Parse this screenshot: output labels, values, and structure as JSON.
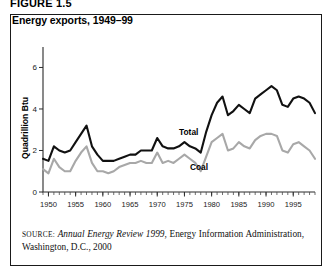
{
  "figure": {
    "label": "FIGURE 1.5"
  },
  "panel": {
    "title": "Energy exports, 1949–99"
  },
  "source": {
    "prefix": "SOURCE:",
    "italic_part": "Annual Energy Review 1999",
    "rest": ", Energy Information Administration, Washington, D.C., 2000"
  },
  "labels": {
    "total": "Total",
    "coal": "Coal"
  },
  "colors": {
    "total_line": "#111111",
    "coal_line": "#a8a8a8",
    "border": "#1a1a1a",
    "axis": "#2b2b2b"
  },
  "chart_data": {
    "type": "line",
    "title": "Energy exports, 1949–99",
    "xlabel": "",
    "ylabel": "Quadrillion Btu",
    "xlim": [
      1949,
      1999
    ],
    "ylim": [
      0,
      6.6
    ],
    "yticks": [
      0,
      2,
      4,
      6
    ],
    "ytick_labels": [
      "0",
      "2",
      "4",
      "6"
    ],
    "xticks": [
      1950,
      1955,
      1960,
      1965,
      1970,
      1975,
      1980,
      1985,
      1990,
      1995
    ],
    "xtick_labels": [
      "1950",
      "1955",
      "1960",
      "1965",
      "1970",
      "1975",
      "1980",
      "1985",
      "1990",
      "1995"
    ],
    "minor_xtick_interval": 1,
    "grid": false,
    "legend": "inline-annotations",
    "x": [
      1949,
      1950,
      1951,
      1952,
      1953,
      1954,
      1955,
      1956,
      1957,
      1958,
      1959,
      1960,
      1961,
      1962,
      1963,
      1964,
      1965,
      1966,
      1967,
      1968,
      1969,
      1970,
      1971,
      1972,
      1973,
      1974,
      1975,
      1976,
      1977,
      1978,
      1979,
      1980,
      1981,
      1982,
      1983,
      1984,
      1985,
      1986,
      1987,
      1988,
      1989,
      1990,
      1991,
      1992,
      1993,
      1994,
      1995,
      1996,
      1997,
      1998,
      1999
    ],
    "series": [
      {
        "name": "Total",
        "color": "#111111",
        "values": [
          1.6,
          1.5,
          2.2,
          2.0,
          1.9,
          2.0,
          2.4,
          2.8,
          3.2,
          2.2,
          1.8,
          1.5,
          1.5,
          1.5,
          1.6,
          1.7,
          1.8,
          1.8,
          2.0,
          2.0,
          2.0,
          2.6,
          2.2,
          2.1,
          2.1,
          2.2,
          2.4,
          2.2,
          2.1,
          1.9,
          2.9,
          3.7,
          4.3,
          4.6,
          3.7,
          3.9,
          4.2,
          4.0,
          3.8,
          4.5,
          4.7,
          4.9,
          5.1,
          4.9,
          4.2,
          4.1,
          4.5,
          4.6,
          4.5,
          4.3,
          3.8
        ]
      },
      {
        "name": "Coal",
        "color": "#a8a8a8",
        "values": [
          1.1,
          0.9,
          1.6,
          1.2,
          1.0,
          1.0,
          1.5,
          1.9,
          2.2,
          1.4,
          1.0,
          1.0,
          0.9,
          1.0,
          1.2,
          1.3,
          1.4,
          1.4,
          1.5,
          1.4,
          1.4,
          1.9,
          1.4,
          1.5,
          1.4,
          1.6,
          1.8,
          1.6,
          1.4,
          1.0,
          1.7,
          2.4,
          2.6,
          2.8,
          2.0,
          2.1,
          2.4,
          2.2,
          2.1,
          2.5,
          2.7,
          2.8,
          2.8,
          2.7,
          2.0,
          1.9,
          2.3,
          2.4,
          2.2,
          2.0,
          1.6
        ]
      }
    ],
    "annotations": [
      {
        "text": "Total",
        "x": 1974,
        "y": 2.75
      },
      {
        "text": "Coal",
        "x": 1976,
        "y": 1.05
      }
    ]
  }
}
